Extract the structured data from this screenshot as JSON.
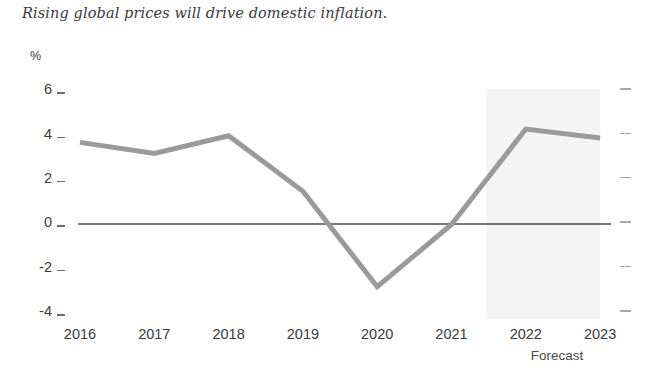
{
  "chart_data": {
    "type": "line",
    "title": "Rising global prices will drive domestic inflation.",
    "xlabel": "",
    "ylabel": "%",
    "unit_label": "%",
    "categories": [
      "2016",
      "2017",
      "2018",
      "2019",
      "2020",
      "2021",
      "2022",
      "2023"
    ],
    "series": [
      {
        "name": "Inflation",
        "values": [
          3.6,
          3.1,
          3.9,
          1.4,
          -2.9,
          -0.1,
          4.2,
          3.8
        ],
        "color": "#9a9a9a"
      }
    ],
    "ylim": [
      -4,
      6
    ],
    "y_ticks": [
      6,
      4,
      2,
      0,
      -2,
      -4
    ],
    "y_tick_labels": [
      "6",
      "4",
      "2",
      "0",
      "-2",
      "-4"
    ],
    "x_tick_labels": [
      "2016",
      "2017",
      "2018",
      "2019",
      "2020",
      "2021",
      "2022",
      "2023"
    ],
    "grid": false,
    "legend": null,
    "annotations": [
      {
        "name": "forecast-region",
        "label": "Forecast",
        "from_category": "2022",
        "to_category": "2023",
        "color": "#f4f4f4"
      }
    ],
    "zero_line": {
      "value": 0,
      "color": "#4a4a4a"
    },
    "right_axis_ticks": [
      6,
      4,
      2,
      0,
      -2,
      -4
    ]
  },
  "labels": {
    "forecast": "Forecast"
  },
  "colors": {
    "line": "#9a9a9a",
    "forecast_band": "#f4f4f4",
    "zero_line": "#4a4a4a",
    "text": "#3a3a3a",
    "tick": "#6e6e6e",
    "tick_right": "#a8a8a8",
    "background": "#ffffff"
  }
}
